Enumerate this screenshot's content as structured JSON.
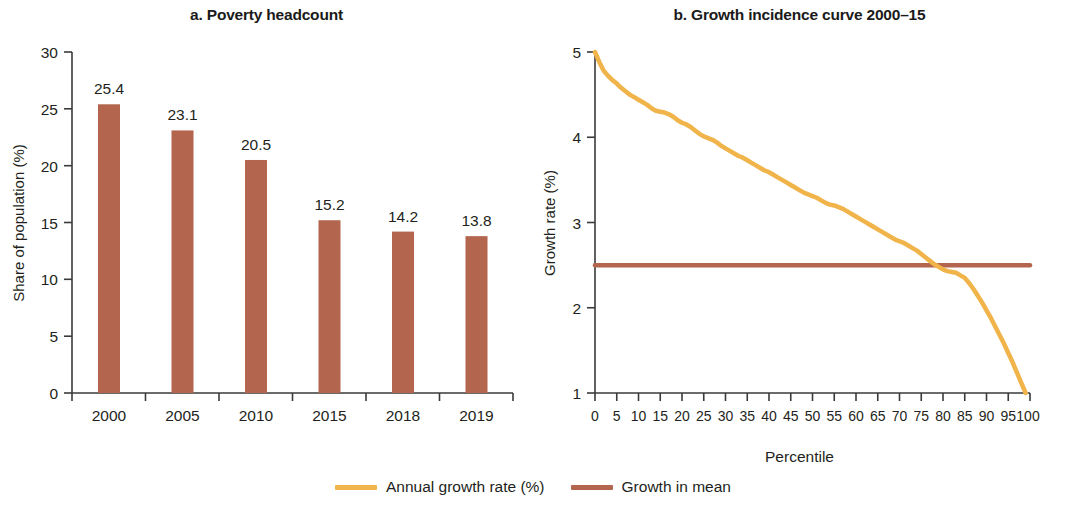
{
  "figure": {
    "background": "#ffffff",
    "panels": [
      {
        "id": "a",
        "title": "a. Poverty headcount"
      },
      {
        "id": "b",
        "title": "b. Growth incidence curve 2000–15"
      }
    ]
  },
  "colors": {
    "bar": "#b4654e",
    "mean_line": "#b4654e",
    "growth_curve": "#f0b44a",
    "axis": "#3a3a3a",
    "text": "#231f20"
  },
  "legend": {
    "items": [
      {
        "label": "Annual growth rate (%)",
        "color": "#f0b44a"
      },
      {
        "label": "Growth in mean",
        "color": "#b4654e"
      }
    ]
  },
  "chart_data": [
    {
      "type": "bar",
      "panel": "a",
      "title": "a. Poverty headcount",
      "xlabel": "",
      "ylabel": "Share of population (%)",
      "categories": [
        "2000",
        "2005",
        "2010",
        "2015",
        "2018",
        "2019"
      ],
      "values": [
        25.4,
        23.1,
        20.5,
        15.2,
        14.2,
        13.8
      ],
      "data_labels": [
        "25.4",
        "23.1",
        "20.5",
        "15.2",
        "14.2",
        "13.8"
      ],
      "ylim": [
        0,
        30
      ],
      "yticks": [
        0,
        5,
        10,
        15,
        20,
        25,
        30
      ],
      "ytick_labels": [
        "0",
        "5",
        "10",
        "15",
        "20",
        "25",
        "30"
      ],
      "grid": false,
      "legend_position": "none",
      "bar_color": "#b4654e"
    },
    {
      "type": "line",
      "panel": "b",
      "title": "b. Growth incidence curve 2000–15",
      "xlabel": "Percentile",
      "ylabel": "Growth rate (%)",
      "xlim": [
        0,
        100
      ],
      "ylim": [
        1,
        5
      ],
      "xticks": [
        0,
        5,
        10,
        15,
        20,
        25,
        30,
        35,
        40,
        45,
        50,
        55,
        60,
        65,
        70,
        75,
        80,
        85,
        90,
        95,
        100
      ],
      "xtick_labels": [
        "0",
        "5",
        "10",
        "15",
        "20",
        "25",
        "30",
        "35",
        "40",
        "45",
        "50",
        "55",
        "60",
        "65",
        "70",
        "75",
        "80",
        "85",
        "90",
        "95",
        "100"
      ],
      "yticks": [
        1,
        2,
        3,
        4,
        5
      ],
      "ytick_labels": [
        "1",
        "2",
        "3",
        "4",
        "5"
      ],
      "grid": false,
      "legend_position": "bottom",
      "series": [
        {
          "name": "Annual growth rate (%)",
          "color": "#f0b44a",
          "x": [
            0,
            1,
            2,
            3,
            4,
            5,
            6,
            7,
            8,
            9,
            10,
            11,
            12,
            13,
            14,
            15,
            16,
            17,
            18,
            19,
            20,
            21,
            22,
            23,
            24,
            25,
            26,
            27,
            28,
            29,
            30,
            31,
            32,
            33,
            34,
            35,
            36,
            37,
            38,
            39,
            40,
            41,
            42,
            43,
            44,
            45,
            46,
            47,
            48,
            49,
            50,
            51,
            52,
            53,
            54,
            55,
            56,
            57,
            58,
            59,
            60,
            61,
            62,
            63,
            64,
            65,
            66,
            67,
            68,
            69,
            70,
            71,
            72,
            73,
            74,
            75,
            76,
            77,
            78,
            79,
            80,
            81,
            82,
            83,
            84,
            85,
            86,
            87,
            88,
            89,
            90,
            91,
            92,
            93,
            94,
            95,
            96,
            97,
            98,
            99
          ],
          "values": [
            5.0,
            4.88,
            4.78,
            4.72,
            4.67,
            4.63,
            4.58,
            4.54,
            4.5,
            4.47,
            4.44,
            4.41,
            4.38,
            4.34,
            4.31,
            4.3,
            4.29,
            4.27,
            4.24,
            4.2,
            4.17,
            4.15,
            4.12,
            4.08,
            4.04,
            4.01,
            3.99,
            3.97,
            3.94,
            3.9,
            3.87,
            3.84,
            3.81,
            3.78,
            3.76,
            3.73,
            3.7,
            3.67,
            3.64,
            3.61,
            3.59,
            3.56,
            3.53,
            3.5,
            3.47,
            3.44,
            3.41,
            3.38,
            3.35,
            3.33,
            3.31,
            3.29,
            3.26,
            3.23,
            3.21,
            3.2,
            3.18,
            3.16,
            3.13,
            3.1,
            3.07,
            3.04,
            3.01,
            2.98,
            2.95,
            2.92,
            2.89,
            2.86,
            2.83,
            2.8,
            2.78,
            2.76,
            2.73,
            2.7,
            2.67,
            2.63,
            2.59,
            2.55,
            2.51,
            2.48,
            2.45,
            2.43,
            2.42,
            2.41,
            2.38,
            2.35,
            2.29,
            2.22,
            2.14,
            2.06,
            1.97,
            1.88,
            1.78,
            1.68,
            1.58,
            1.47,
            1.36,
            1.24,
            1.12,
            1.0
          ]
        },
        {
          "name": "Growth in mean",
          "color": "#b4654e",
          "x": [
            0,
            100
          ],
          "values": [
            2.5,
            2.5
          ]
        }
      ]
    }
  ]
}
